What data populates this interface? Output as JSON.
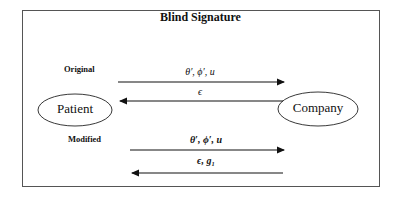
{
  "title": "Blind Signature",
  "sections": [
    {
      "label": "Original",
      "forward_msg": "θ′, ϕ′, u",
      "return_msg": "ϵ"
    },
    {
      "label": "Modified",
      "forward_msg": "θ′, ϕ′, u",
      "return_msg": "ϵ, g₁"
    }
  ],
  "nodes": {
    "left": "Patient",
    "right": "Company"
  },
  "colors": {
    "stroke": "#111111",
    "frame": "#555555"
  }
}
